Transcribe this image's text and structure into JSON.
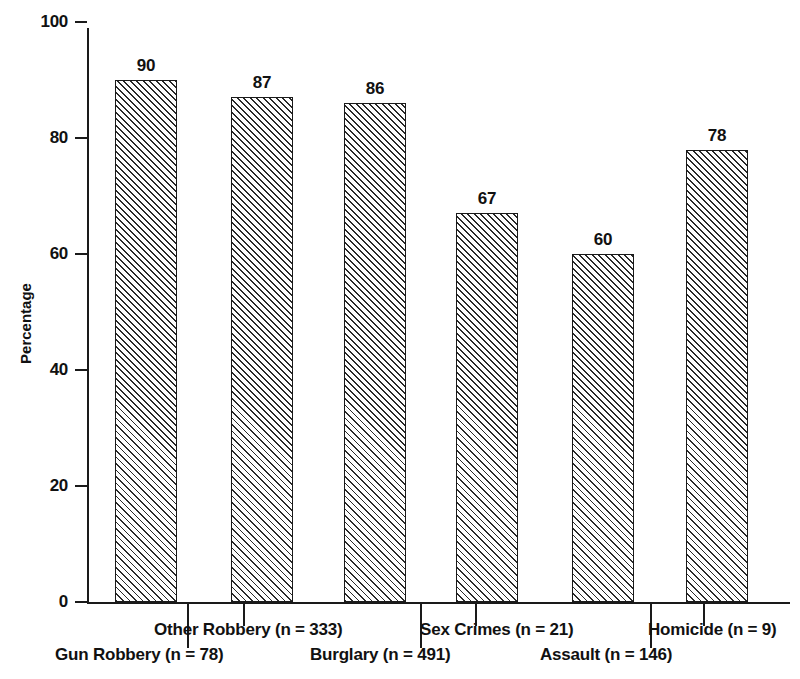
{
  "chart_data": {
    "type": "bar",
    "title": "",
    "subtitle": "",
    "xlabel": "",
    "ylabel": "Percentage",
    "ylim": [
      0,
      100
    ],
    "ytick_labels": [
      "0",
      "20",
      "40",
      "60",
      "80",
      "100"
    ],
    "ytick_values": [
      0,
      20,
      40,
      60,
      80,
      100
    ],
    "grid": false,
    "legend": false,
    "legend_position": "none",
    "categories": [
      "Gun Robbery (n = 78)",
      "Other Robbery (n = 333)",
      "Burglary (n = 491)",
      "Sex Crimes (n = 21)",
      "Assault (n = 146)",
      "Homicide (n = 9)"
    ],
    "values": [
      90,
      87,
      86,
      67,
      60,
      78
    ],
    "value_labels": [
      "90",
      "87",
      "86",
      "67",
      "60",
      "78"
    ],
    "bar_fill": "diagonal-hatch",
    "bar_edge_color": "#1a1a1a",
    "bar_face_color": "#ffffff",
    "annotations": []
  },
  "axis": {
    "y_title": "Percentage",
    "ticks": [
      {
        "label": "100",
        "value": 100
      },
      {
        "label": "80",
        "value": 80
      },
      {
        "label": "60",
        "value": 60
      },
      {
        "label": "40",
        "value": 40
      },
      {
        "label": "20",
        "value": 20
      },
      {
        "label": "0",
        "value": 0
      }
    ]
  },
  "bars": [
    {
      "label": "Gun Robbery (n = 78)",
      "value": 90,
      "value_label": "90",
      "row": 1
    },
    {
      "label": "Other Robbery (n = 333)",
      "value": 87,
      "value_label": "87",
      "row": 0
    },
    {
      "label": "Burglary (n = 491)",
      "value": 86,
      "value_label": "86",
      "row": 1
    },
    {
      "label": "Sex Crimes (n = 21)",
      "value": 67,
      "value_label": "67",
      "row": 0
    },
    {
      "label": "Assault (n = 146)",
      "value": 60,
      "value_label": "60",
      "row": 1
    },
    {
      "label": "Homicide (n = 9)",
      "value": 78,
      "value_label": "78",
      "row": 0
    }
  ]
}
